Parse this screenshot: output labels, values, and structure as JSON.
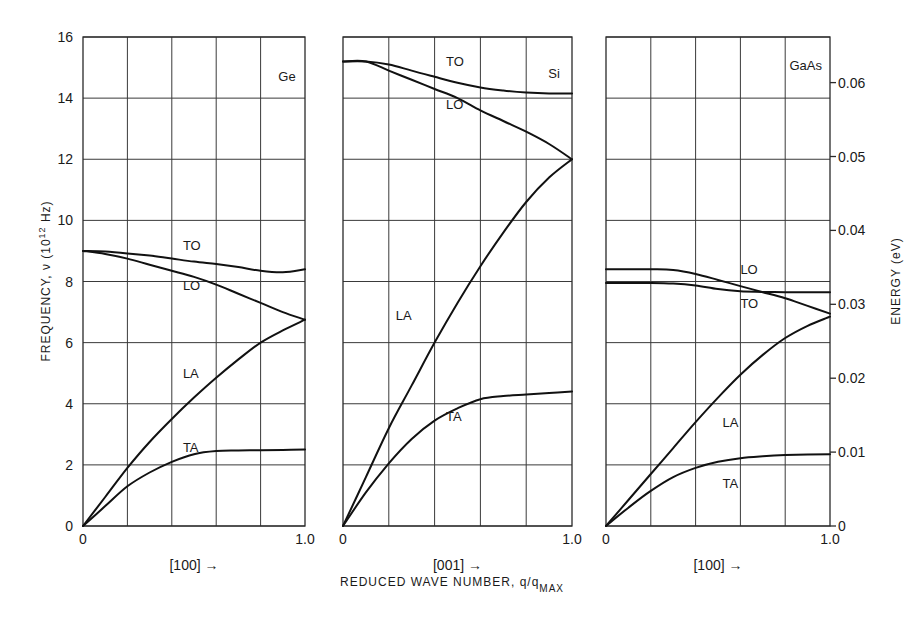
{
  "chart_data": {
    "type": "line",
    "title": "",
    "xlabel": "REDUCED WAVE NUMBER, q/q_MAX",
    "xlabel_main": "REDUCED WAVE NUMBER, q/q",
    "xlabel_sub": "MAX",
    "ylabel": "FREQUENCY, ν (10^12 Hz)",
    "ylabel_main": "FREQUENCY, ν (10",
    "ylabel_sup": "12",
    "ylabel_tail": " Hz)",
    "y2label": "ENERGY (eV)",
    "ylim": [
      0,
      16
    ],
    "y_ticks": [
      "0",
      "2",
      "4",
      "6",
      "8",
      "10",
      "12",
      "14",
      "16"
    ],
    "y2_ticks": [
      {
        "label": "0",
        "value": 0
      },
      {
        "label": "0.01",
        "value": 0.01
      },
      {
        "label": "0.02",
        "value": 0.02
      },
      {
        "label": "0.03",
        "value": 0.03
      },
      {
        "label": "0.04",
        "value": 0.04
      },
      {
        "label": "0.05",
        "value": 0.05
      },
      {
        "label": "0.06",
        "value": 0.06
      }
    ],
    "grid": true,
    "panels": [
      {
        "material": "Ge",
        "direction": "[100]",
        "x_ticks": [
          "0",
          "1.0"
        ],
        "xlim": [
          0,
          1.0
        ],
        "series": [
          {
            "name": "TO",
            "x": [
              0,
              0.1,
              0.2,
              0.3,
              0.4,
              0.5,
              0.6,
              0.7,
              0.8,
              0.9,
              1.0
            ],
            "values": [
              9.0,
              8.98,
              8.92,
              8.85,
              8.75,
              8.65,
              8.57,
              8.47,
              8.35,
              8.3,
              8.4
            ]
          },
          {
            "name": "LO",
            "x": [
              0,
              0.1,
              0.2,
              0.3,
              0.4,
              0.5,
              0.6,
              0.7,
              0.8,
              0.9,
              1.0
            ],
            "values": [
              9.0,
              8.9,
              8.75,
              8.55,
              8.35,
              8.15,
              7.9,
              7.6,
              7.3,
              7.0,
              6.75
            ]
          },
          {
            "name": "LA",
            "x": [
              0,
              0.1,
              0.2,
              0.3,
              0.4,
              0.5,
              0.6,
              0.7,
              0.8,
              0.9,
              1.0
            ],
            "values": [
              0,
              0.95,
              1.9,
              2.75,
              3.5,
              4.2,
              4.85,
              5.45,
              6.0,
              6.4,
              6.75
            ]
          },
          {
            "name": "TA",
            "x": [
              0,
              0.1,
              0.2,
              0.3,
              0.4,
              0.5,
              0.6,
              0.7,
              0.8,
              0.9,
              1.0
            ],
            "values": [
              0,
              0.65,
              1.3,
              1.75,
              2.1,
              2.35,
              2.45,
              2.47,
              2.48,
              2.49,
              2.5
            ]
          }
        ]
      },
      {
        "material": "Si",
        "direction": "[001]",
        "x_ticks": [
          "0",
          "1.0"
        ],
        "xlim": [
          0,
          1.0
        ],
        "series": [
          {
            "name": "TO",
            "x": [
              0,
              0.1,
              0.2,
              0.3,
              0.4,
              0.5,
              0.6,
              0.7,
              0.8,
              0.9,
              1.0
            ],
            "values": [
              15.2,
              15.2,
              15.1,
              14.9,
              14.7,
              14.5,
              14.35,
              14.25,
              14.18,
              14.15,
              14.15
            ]
          },
          {
            "name": "LO",
            "x": [
              0,
              0.1,
              0.2,
              0.3,
              0.4,
              0.5,
              0.6,
              0.7,
              0.8,
              0.9,
              1.0
            ],
            "values": [
              15.2,
              15.2,
              14.9,
              14.6,
              14.3,
              14.0,
              13.6,
              13.25,
              12.9,
              12.5,
              12.0
            ]
          },
          {
            "name": "LA",
            "x": [
              0,
              0.1,
              0.2,
              0.3,
              0.4,
              0.5,
              0.6,
              0.7,
              0.8,
              0.9,
              1.0
            ],
            "values": [
              0,
              1.6,
              3.2,
              4.6,
              6.0,
              7.3,
              8.5,
              9.6,
              10.6,
              11.4,
              12.0
            ]
          },
          {
            "name": "TA",
            "x": [
              0,
              0.1,
              0.2,
              0.3,
              0.4,
              0.5,
              0.6,
              0.7,
              0.8,
              0.9,
              1.0
            ],
            "values": [
              0,
              1.1,
              2.05,
              2.85,
              3.45,
              3.85,
              4.15,
              4.25,
              4.3,
              4.35,
              4.4
            ]
          }
        ]
      },
      {
        "material": "GaAs",
        "direction": "[100]",
        "x_ticks": [
          "0",
          "1.0"
        ],
        "xlim": [
          0,
          1.0
        ],
        "series": [
          {
            "name": "LO",
            "x": [
              0,
              0.1,
              0.2,
              0.3,
              0.4,
              0.5,
              0.6,
              0.7,
              0.8,
              0.9,
              1.0
            ],
            "values": [
              8.4,
              8.4,
              8.4,
              8.38,
              8.25,
              8.05,
              7.85,
              7.65,
              7.45,
              7.2,
              6.95
            ]
          },
          {
            "name": "TO",
            "x": [
              0,
              0.1,
              0.2,
              0.3,
              0.4,
              0.5,
              0.6,
              0.7,
              0.8,
              0.9,
              1.0
            ],
            "values": [
              7.95,
              7.95,
              7.95,
              7.93,
              7.87,
              7.75,
              7.68,
              7.66,
              7.65,
              7.65,
              7.65
            ]
          },
          {
            "name": "LA",
            "x": [
              0,
              0.1,
              0.2,
              0.3,
              0.4,
              0.5,
              0.6,
              0.7,
              0.8,
              0.9,
              1.0
            ],
            "values": [
              0,
              0.85,
              1.7,
              2.55,
              3.4,
              4.2,
              4.95,
              5.6,
              6.15,
              6.55,
              6.85
            ]
          },
          {
            "name": "TA",
            "x": [
              0,
              0.1,
              0.2,
              0.3,
              0.4,
              0.5,
              0.6,
              0.7,
              0.8,
              0.9,
              1.0
            ],
            "values": [
              0,
              0.6,
              1.15,
              1.6,
              1.9,
              2.1,
              2.22,
              2.28,
              2.32,
              2.34,
              2.35
            ]
          }
        ]
      }
    ]
  },
  "labels": {
    "ge_panel": "Ge",
    "si_panel": "Si",
    "gaas_panel": "GaAs",
    "arrow": "→"
  },
  "curve_label_positions": [
    {
      "panel": 0,
      "name": "TO",
      "x": 0.45,
      "y": 9.2
    },
    {
      "panel": 0,
      "name": "LO",
      "x": 0.45,
      "y": 7.9
    },
    {
      "panel": 0,
      "name": "LA",
      "x": 0.45,
      "y": 5.0
    },
    {
      "panel": 0,
      "name": "TA",
      "x": 0.45,
      "y": 2.6
    },
    {
      "panel": 1,
      "name": "TO",
      "x": 0.45,
      "y": 15.2
    },
    {
      "panel": 1,
      "name": "LO",
      "x": 0.45,
      "y": 13.8
    },
    {
      "panel": 1,
      "name": "LA",
      "x": 0.23,
      "y": 6.9
    },
    {
      "panel": 1,
      "name": "TA",
      "x": 0.45,
      "y": 3.6
    },
    {
      "panel": 2,
      "name": "LO",
      "x": 0.6,
      "y": 8.4
    },
    {
      "panel": 2,
      "name": "TO",
      "x": 0.6,
      "y": 7.3
    },
    {
      "panel": 2,
      "name": "LA",
      "x": 0.52,
      "y": 3.4
    },
    {
      "panel": 2,
      "name": "TA",
      "x": 0.52,
      "y": 1.4
    }
  ]
}
